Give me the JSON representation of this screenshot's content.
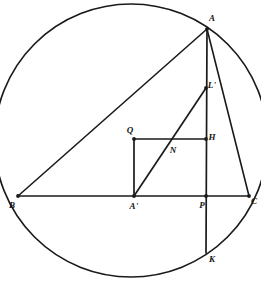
{
  "figure": {
    "background_color": "#ffffff",
    "stroke_color": "#1a1a1a",
    "canvas": {
      "width": 261,
      "height": 287
    }
  },
  "circle": {
    "name": "circumcircle",
    "center_x": 131,
    "center_y": 140.5,
    "radius": 136.5
  },
  "points": [
    {
      "id": "A",
      "label": "A",
      "x": 207,
      "y": 29,
      "label_x": 212,
      "label_y": 18,
      "dot": true
    },
    {
      "id": "B",
      "label": "B",
      "x": 18,
      "y": 196,
      "label_x": 12,
      "label_y": 205,
      "dot": true
    },
    {
      "id": "C",
      "label": "C",
      "x": 249,
      "y": 196,
      "label_x": 254,
      "label_y": 201,
      "dot": true
    },
    {
      "id": "Ap",
      "label": "A'",
      "x": 134,
      "y": 196,
      "label_x": 134,
      "label_y": 206,
      "dot": true
    },
    {
      "id": "Lp",
      "label": "L'",
      "x": 206,
      "y": 88,
      "label_x": 212,
      "label_y": 85,
      "dot": true
    },
    {
      "id": "Q",
      "label": "Q",
      "x": 134,
      "y": 139,
      "label_x": 130,
      "label_y": 130,
      "dot": true
    },
    {
      "id": "H",
      "label": "H",
      "x": 206,
      "y": 139,
      "label_x": 212,
      "label_y": 137,
      "dot": true
    },
    {
      "id": "N",
      "label": "N",
      "x": 172,
      "y": 141,
      "label_x": 173,
      "label_y": 150,
      "dot": false
    },
    {
      "id": "P",
      "label": "P",
      "x": 206,
      "y": 196,
      "label_x": 202,
      "label_y": 205,
      "dot": true
    },
    {
      "id": "K",
      "label": "K",
      "x": 206,
      "y": 253,
      "label_x": 212,
      "label_y": 259,
      "dot": false
    }
  ],
  "segments": [
    {
      "name": "chord-A-B",
      "from": "A",
      "to": "B",
      "kind": "chord"
    },
    {
      "name": "chord-A-C",
      "from": "A",
      "to": "C",
      "kind": "chord"
    },
    {
      "name": "base-B-C",
      "from": "B",
      "to": "C",
      "kind": "chord"
    },
    {
      "name": "altitude-A-K",
      "from": "A",
      "to": "K",
      "kind": "aux"
    },
    {
      "name": "median-Ap-Lp",
      "from": "Ap",
      "to": "Lp",
      "kind": "aux"
    },
    {
      "name": "perp-Ap-Q",
      "from": "Ap",
      "to": "Q",
      "kind": "aux"
    },
    {
      "name": "line-Q-H",
      "from": "Q",
      "to": "H",
      "kind": "aux"
    }
  ]
}
